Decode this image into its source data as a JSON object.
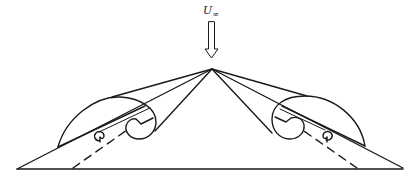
{
  "figure": {
    "type": "schematic",
    "freestream_label": {
      "symbol": "U",
      "subscript": "∞"
    },
    "colors": {
      "stroke": "#1a1a1a",
      "background": "#ffffff"
    },
    "elements": [
      "freestream-arrow",
      "wing-baseline",
      "left-wing-leading-edge",
      "right-wing-leading-edge",
      "left-primary-vortex",
      "right-primary-vortex",
      "left-secondary-vortex",
      "right-secondary-vortex",
      "left-vortex-axis-dashed",
      "right-vortex-axis-dashed"
    ]
  }
}
